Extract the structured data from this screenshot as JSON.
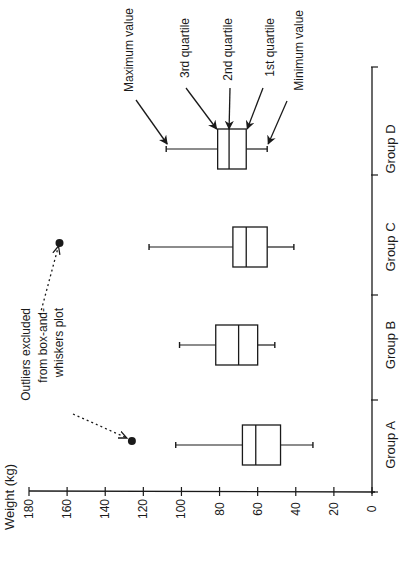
{
  "chart_data": {
    "type": "boxplot",
    "orientation": "rotated 90deg counterclockwise (value axis runs horizontally along bottom, categories stacked bottom-to-top)",
    "title": "",
    "xlabel": "",
    "ylabel": "Weight (kg)",
    "ylim": [
      0,
      180
    ],
    "yticks": [
      0,
      20,
      40,
      60,
      80,
      100,
      120,
      140,
      160,
      180
    ],
    "grid": false,
    "legend": null,
    "categories": [
      "Group A",
      "Group B",
      "Group C",
      "Group D"
    ],
    "series": [
      {
        "name": "Group A",
        "min": 31,
        "q1": 48,
        "median": 61,
        "q3": 68,
        "max": 103,
        "outliers": [
          126
        ]
      },
      {
        "name": "Group B",
        "min": 51,
        "q1": 60,
        "median": 70,
        "q3": 82,
        "max": 101,
        "outliers": []
      },
      {
        "name": "Group C",
        "min": 41,
        "q1": 55,
        "median": 66,
        "q3": 73,
        "max": 117,
        "outliers": [
          164
        ]
      },
      {
        "name": "Group D",
        "min": 55,
        "q1": 66,
        "median": 75,
        "q3": 81,
        "max": 108,
        "outliers": []
      }
    ],
    "annotations": [
      {
        "text": "Maximum value",
        "target": "Group D max"
      },
      {
        "text": "3rd quartile",
        "target": "Group D q3"
      },
      {
        "text": "2nd quartile",
        "target": "Group D median"
      },
      {
        "text": "1st quartile",
        "target": "Group D q1"
      },
      {
        "text": "Minimum value",
        "target": "Group D min"
      },
      {
        "text": "Outliers excluded from box-and-whiskers plot",
        "lines": [
          "Outliers excluded",
          "from box-and-",
          "whiskers plot"
        ],
        "target": "outliers (Group A, Group C)"
      }
    ]
  }
}
